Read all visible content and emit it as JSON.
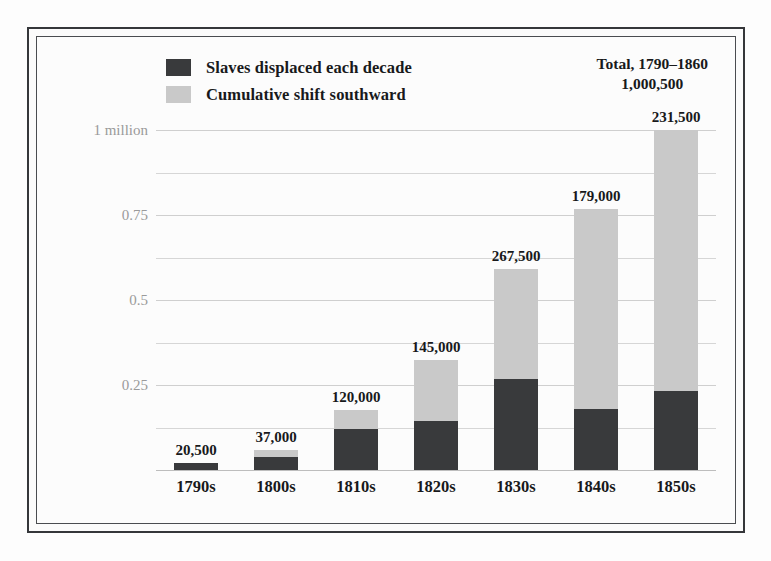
{
  "figure": {
    "legend": [
      {
        "label": "Slaves displaced each decade",
        "color": "#393a3c",
        "swatch": "dark-swatch"
      },
      {
        "label": "Cumulative shift southward",
        "color": "#c9c9c9",
        "swatch": "light-swatch"
      }
    ],
    "total_callout": {
      "line1": "Total, 1790–1860",
      "line2": "1,000,500"
    }
  },
  "chart_data": {
    "type": "bar",
    "stacked": true,
    "title": "",
    "xlabel": "",
    "ylabel": "",
    "ylim": [
      0,
      1000000
    ],
    "grid": true,
    "legend_position": "top-left",
    "categories": [
      "1790s",
      "1800s",
      "1810s",
      "1820s",
      "1830s",
      "1840s",
      "1850s"
    ],
    "ytick_values": [
      250000,
      500000,
      750000,
      1000000
    ],
    "ytick_labels": [
      "0.25",
      "0.5",
      "0.75",
      "1 million"
    ],
    "minor_ytick_values": [
      125000,
      375000,
      625000,
      875000
    ],
    "series": [
      {
        "name": "Slaves displaced each decade",
        "color": "#393a3c",
        "values": [
          20500,
          37000,
          120000,
          145000,
          267500,
          179000,
          231500
        ],
        "labels": [
          "20,500",
          "37,000",
          "120,000",
          "145,000",
          "267,500",
          "179,000",
          "231,500"
        ]
      },
      {
        "name": "Cumulative shift southward",
        "color": "#c9c9c9",
        "values": [
          20500,
          57500,
          177500,
          322500,
          590000,
          769000,
          1000500
        ],
        "labels": [
          "20,500",
          "57,500",
          "177,500",
          "322,500",
          "590,000",
          "769,000",
          "1,000,500"
        ]
      }
    ]
  }
}
